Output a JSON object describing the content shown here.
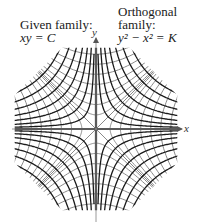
{
  "labels": {
    "given": {
      "title": "Given family:",
      "equation": "xy = C"
    },
    "orthogonal": {
      "title_line1": "Orthogonal",
      "title_line2": "family:",
      "equation": "y² − x² = K"
    },
    "x_axis": "x",
    "y_axis": "y"
  },
  "colors": {
    "given_curves": "#1a1a1a",
    "orthogonal_curves": "#8a8a8a",
    "axes": "#9a9a9a"
  },
  "geometry": {
    "origin": [
      96,
      129
    ],
    "scale": 1,
    "clip_radius": 88,
    "given_C_values": [
      150,
      380,
      700,
      1100,
      1600,
      2200,
      2900,
      3700
    ],
    "orthogonal_K_values": [
      -5600,
      -4200,
      -3000,
      -2000,
      -1200,
      -600,
      -200,
      0,
      200,
      600,
      1200,
      2000,
      3000,
      4200,
      5600
    ]
  }
}
